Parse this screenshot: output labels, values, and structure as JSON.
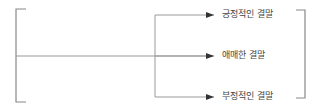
{
  "diagram": {
    "outcomes": [
      {
        "label": "긍정적인 결말",
        "y": 15
      },
      {
        "label": "애매한 결말",
        "y": 56
      },
      {
        "label": "부정적인 결말",
        "y": 97
      }
    ],
    "colors": {
      "line": "#888888",
      "arrow": "#333333",
      "bracket": "#888888",
      "text": "#444444"
    }
  }
}
